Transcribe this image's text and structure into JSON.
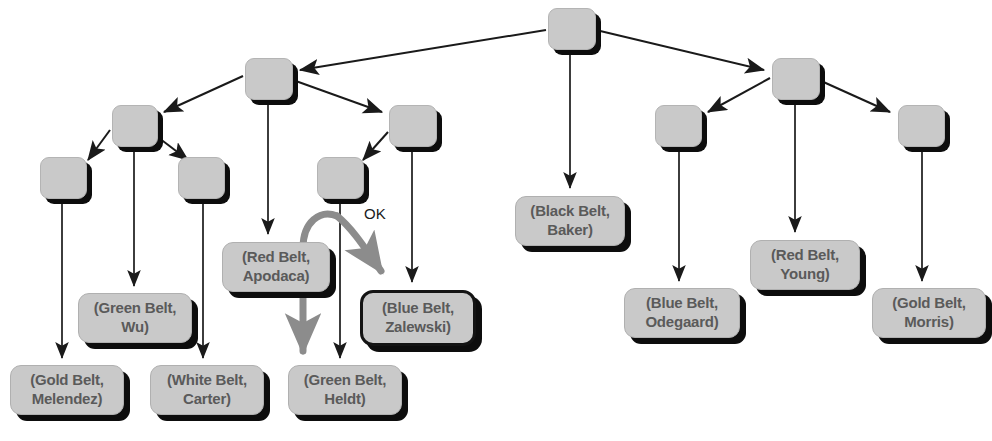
{
  "diagram": {
    "type": "tree-graph",
    "background_color": "#ffffff",
    "node_fill_color": "#c9c9c9",
    "node_shadow_color": "#0d0d0d",
    "edge_color": "#1a1a1a",
    "highlight_arrow_color": "#8c8c8c",
    "label_text_color": "#5a5a5a",
    "annotation": {
      "text": "OK",
      "x": 372,
      "y": 213
    },
    "internal_nodes": [
      {
        "id": "root",
        "x": 548,
        "y": 8,
        "w": 46,
        "h": 40
      },
      {
        "id": "n-l1",
        "x": 245,
        "y": 58,
        "w": 46,
        "h": 40
      },
      {
        "id": "n-r1",
        "x": 772,
        "y": 58,
        "w": 46,
        "h": 40
      },
      {
        "id": "n-l2",
        "x": 112,
        "y": 105,
        "w": 44,
        "h": 40
      },
      {
        "id": "n-l3",
        "x": 389,
        "y": 105,
        "w": 46,
        "h": 40
      },
      {
        "id": "n-r2",
        "x": 655,
        "y": 105,
        "w": 45,
        "h": 40
      },
      {
        "id": "n-r3",
        "x": 898,
        "y": 105,
        "w": 45,
        "h": 40
      },
      {
        "id": "n-l4",
        "x": 40,
        "y": 157,
        "w": 45,
        "h": 40
      },
      {
        "id": "n-l5",
        "x": 178,
        "y": 157,
        "w": 45,
        "h": 40
      },
      {
        "id": "n-l6",
        "x": 317,
        "y": 157,
        "w": 45,
        "h": 40
      }
    ],
    "leaf_labels": [
      {
        "id": "gold-melendez",
        "lines": [
          "(Gold Belt,",
          "Melendez)"
        ],
        "x": 10,
        "y": 365,
        "w": 112,
        "h": 48,
        "selected": false
      },
      {
        "id": "green-wu",
        "lines": [
          "(Green Belt,",
          "Wu)"
        ],
        "x": 78,
        "y": 293,
        "w": 112,
        "h": 48,
        "selected": false
      },
      {
        "id": "white-carter",
        "lines": [
          "(White Belt,",
          "Carter)"
        ],
        "x": 150,
        "y": 365,
        "w": 112,
        "h": 48,
        "selected": false
      },
      {
        "id": "red-apodaca",
        "lines": [
          "(Red Belt,",
          "Apodaca)"
        ],
        "x": 222,
        "y": 242,
        "w": 106,
        "h": 48,
        "selected": false
      },
      {
        "id": "green-heldt",
        "lines": [
          "(Green Belt,",
          "Heldt)"
        ],
        "x": 288,
        "y": 365,
        "w": 112,
        "h": 48,
        "selected": false
      },
      {
        "id": "blue-zalewski",
        "lines": [
          "(Blue Belt,",
          "Zalewski)"
        ],
        "x": 360,
        "y": 290,
        "w": 110,
        "h": 50,
        "selected": true
      },
      {
        "id": "black-baker",
        "lines": [
          "(Black Belt,",
          "Baker)"
        ],
        "x": 515,
        "y": 196,
        "w": 108,
        "h": 48,
        "selected": false
      },
      {
        "id": "blue-odegaard",
        "lines": [
          "(Blue Belt,",
          "Odegaard)"
        ],
        "x": 624,
        "y": 288,
        "w": 114,
        "h": 48,
        "selected": false
      },
      {
        "id": "red-young",
        "lines": [
          "(Red Belt,",
          "Young)"
        ],
        "x": 750,
        "y": 240,
        "w": 108,
        "h": 48,
        "selected": false
      },
      {
        "id": "gold-morris",
        "lines": [
          "(Gold Belt,",
          "Morris)"
        ],
        "x": 872,
        "y": 288,
        "w": 112,
        "h": 48,
        "selected": false
      }
    ]
  }
}
